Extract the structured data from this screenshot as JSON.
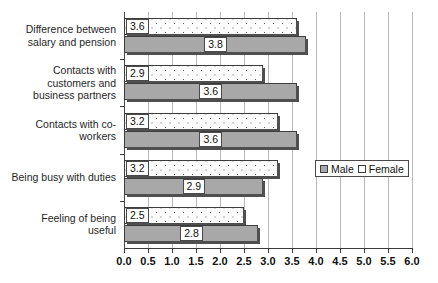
{
  "chart_data": {
    "type": "bar",
    "orientation": "horizontal",
    "title": "",
    "xlabel": "",
    "ylabel": "",
    "xlim": [
      0.0,
      6.0
    ],
    "xtick_step": 0.5,
    "grid": true,
    "legend_position": "right-middle",
    "categories": [
      "Difference between salary and pension",
      "Contacts with customers and business partners",
      "Contacts with co-workers",
      "Being busy with duties",
      "Feeling of being useful"
    ],
    "series": [
      {
        "name": "Male",
        "color": "#a8a8a8",
        "values": [
          3.8,
          3.6,
          3.6,
          2.9,
          2.8
        ]
      },
      {
        "name": "Female",
        "color": "#ffffff",
        "values": [
          3.6,
          2.9,
          3.2,
          3.2,
          2.5
        ]
      }
    ],
    "tick_labels": [
      "0.0",
      "0.5",
      "1.0",
      "1.5",
      "2.0",
      "2.5",
      "3.0",
      "3.5",
      "4.0",
      "4.5",
      "5.0",
      "5.5",
      "6.0"
    ],
    "tick_values": [
      0.0,
      0.5,
      1.0,
      1.5,
      2.0,
      2.5,
      3.0,
      3.5,
      4.0,
      4.5,
      5.0,
      5.5,
      6.0
    ],
    "data_labels": {
      "female": [
        "3.6",
        "2.9",
        "3.2",
        "3.2",
        "2.5"
      ],
      "male": [
        "3.8",
        "3.6",
        "3.6",
        "2.9",
        "2.8"
      ]
    }
  },
  "categories_display": [
    [
      "Difference between",
      "salary and pension"
    ],
    [
      "Contacts with",
      "customers and",
      "business partners"
    ],
    [
      "Contacts with co-",
      "workers"
    ],
    [
      "Being busy with duties"
    ],
    [
      "Feeling of being",
      "useful"
    ]
  ],
  "legend": {
    "male_label": "Male",
    "female_label": "Female"
  }
}
